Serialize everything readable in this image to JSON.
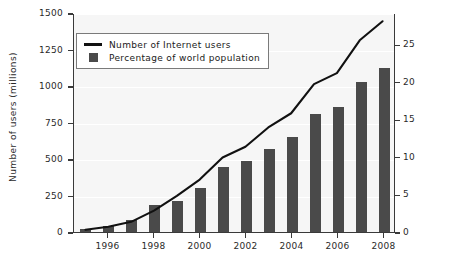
{
  "chart_data": {
    "type": "bar",
    "title": "",
    "subtitle": "",
    "xlabel": "",
    "ylabel": "Number of users (millions)",
    "ylabel_right": "Percentage of world population",
    "grid": true,
    "legend_position": "top-left",
    "x": [
      1995,
      1996,
      1997,
      1998,
      1999,
      2000,
      2001,
      2002,
      2003,
      2004,
      2005,
      2006,
      2007,
      2008
    ],
    "categories": [
      "1995",
      "1996",
      "1997",
      "1998",
      "1999",
      "2000",
      "2001",
      "2002",
      "2003",
      "2004",
      "2005",
      "2006",
      "2007",
      "2008"
    ],
    "xtick_labels": [
      "1996",
      "1998",
      "2000",
      "2002",
      "2004",
      "2006",
      "2008"
    ],
    "xtick_values": [
      1996,
      1998,
      2000,
      2002,
      2004,
      2006,
      2008
    ],
    "ylim": [
      0,
      1500
    ],
    "ytick_labels": [
      "0",
      "250",
      "500",
      "750",
      "1000",
      "1250",
      "1500"
    ],
    "ytick_values": [
      0,
      250,
      500,
      750,
      1000,
      1250,
      1500
    ],
    "ylim_right": [
      0,
      29.16
    ],
    "ytick_labels_right": [
      "0",
      "5",
      "10",
      "15",
      "20",
      "25"
    ],
    "ytick_values_right": [
      0,
      5,
      10,
      15,
      20,
      25
    ],
    "series": [
      {
        "name": "Number of Internet users",
        "type": "line",
        "axis": "left",
        "unit": "millions",
        "color": "#111111",
        "values": [
          16,
          36,
          70,
          147,
          248,
          361,
          513,
          587,
          719,
          817,
          1018,
          1093,
          1319,
          1450
        ]
      },
      {
        "name": "Percentage of world population",
        "type": "bar",
        "axis": "right",
        "unit": "percent",
        "color": "#4a4a4a",
        "values": [
          0.4,
          0.8,
          1.6,
          3.6,
          4.1,
          5.8,
          8.6,
          9.4,
          11.0,
          12.7,
          15.7,
          16.7,
          20.0,
          21.9
        ]
      }
    ]
  },
  "legend": {
    "items": [
      {
        "label": "Number of Internet users",
        "key": "line-key-icon"
      },
      {
        "label": "Percentage of world population",
        "key": "square-swatch-icon"
      }
    ]
  },
  "colors": {
    "bar": "#4a4a4a",
    "line": "#111111",
    "plot_background": "#f6f6f6",
    "page_background": "#ffffff",
    "axis": "#3a3a3a",
    "gridline": "#ffffff",
    "text": "#2a2a2a"
  }
}
